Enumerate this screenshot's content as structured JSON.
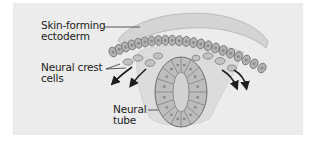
{
  "figure": {
    "type": "biology-diagram",
    "colors": {
      "background": "#ffffff",
      "panel": "#ececec",
      "ectoderm_layer": "#c9c9c9",
      "cell_fill": "#b3b3b3",
      "cell_outline": "#6e6e6e",
      "nucleus": "#8a8a8a",
      "leader_line": "#333333",
      "arrow": "#1e1e1e",
      "text": "#222222"
    }
  },
  "labels": [
    {
      "id": "skin-forming-ectoderm",
      "lines": [
        "Skin-forming",
        "ectoderm"
      ]
    },
    {
      "id": "neural-crest-cells",
      "lines": [
        "Neural crest",
        "cells"
      ]
    },
    {
      "id": "neural-tube",
      "lines": [
        "Neural",
        "tube"
      ]
    }
  ],
  "annotations": {
    "arrows_left_count": 2,
    "arrows_right_count": 2,
    "ectoderm_cell_count": 22
  }
}
